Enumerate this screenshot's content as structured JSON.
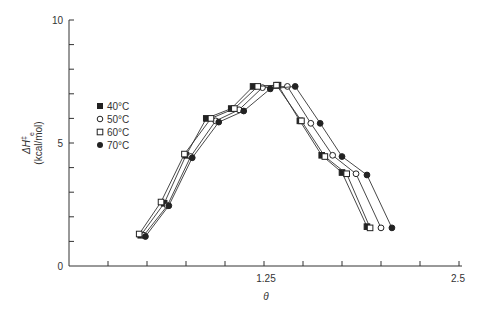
{
  "chart_data": {
    "type": "line",
    "title": "",
    "xlabel": "θ",
    "ylabel": "ΔH‡e (kcal/mol)",
    "ylabel_line1": "ΔH",
    "ylabel_line2": "(kcal/mol)",
    "xlim": [
      0,
      2.5
    ],
    "ylim": [
      0,
      10
    ],
    "x_ticks": [
      0.25,
      0.5,
      0.75,
      1.0,
      1.25,
      1.5,
      1.75,
      2.0,
      2.25,
      2.5
    ],
    "x_tick_labels": [
      {
        "value": 1.25,
        "label": "1.25"
      },
      {
        "value": 2.5,
        "label": "2.5"
      }
    ],
    "y_ticks": [
      1,
      2,
      3,
      4,
      5,
      6,
      7,
      8,
      9,
      10
    ],
    "y_tick_labels": [
      {
        "value": 0,
        "label": "0"
      },
      {
        "value": 5,
        "label": "5"
      },
      {
        "value": 10,
        "label": "10"
      }
    ],
    "grid": false,
    "legend_position": "upper-left",
    "series": [
      {
        "name": "40°C",
        "marker": "filled-square",
        "x": [
          0.46,
          0.61,
          0.75,
          0.88,
          1.04,
          1.18,
          1.34,
          1.48,
          1.62,
          1.75,
          1.91
        ],
        "y": [
          1.25,
          2.55,
          4.5,
          6.0,
          6.4,
          7.3,
          7.35,
          5.9,
          4.5,
          3.8,
          1.6
        ]
      },
      {
        "name": "50°C",
        "marker": "open-circle",
        "x": [
          0.48,
          0.63,
          0.78,
          0.94,
          1.09,
          1.24,
          1.4,
          1.55,
          1.69,
          1.84,
          2.0
        ],
        "y": [
          1.25,
          2.45,
          4.45,
          5.9,
          6.35,
          7.25,
          7.3,
          5.8,
          4.5,
          3.75,
          1.55
        ]
      },
      {
        "name": "60°C",
        "marker": "open-square",
        "x": [
          0.45,
          0.59,
          0.74,
          0.91,
          1.06,
          1.21,
          1.33,
          1.49,
          1.64,
          1.78,
          1.93
        ],
        "y": [
          1.3,
          2.6,
          4.55,
          6.0,
          6.4,
          7.3,
          7.35,
          5.9,
          4.45,
          3.75,
          1.55
        ]
      },
      {
        "name": "70°C",
        "marker": "filled-circle",
        "x": [
          0.49,
          0.64,
          0.79,
          0.96,
          1.12,
          1.29,
          1.45,
          1.61,
          1.75,
          1.91,
          2.07
        ],
        "y": [
          1.2,
          2.45,
          4.4,
          5.85,
          6.3,
          7.2,
          7.3,
          5.8,
          4.45,
          3.7,
          1.55
        ]
      }
    ]
  },
  "legend": {
    "items": [
      {
        "label": "40°C",
        "marker": "filled-square"
      },
      {
        "label": "50°C",
        "marker": "open-circle"
      },
      {
        "label": "60°C",
        "marker": "open-square"
      },
      {
        "label": "70°C",
        "marker": "filled-circle"
      }
    ]
  },
  "axes": {
    "x_title": "θ",
    "y_title_main": "ΔH",
    "y_title_sup": "‡",
    "y_title_sub": "e",
    "y_title_units": "(kcal/mol)",
    "y_label_0": "0",
    "y_label_5": "5",
    "y_label_10": "10",
    "x_label_125": "1.25",
    "x_label_25": "2.5"
  }
}
